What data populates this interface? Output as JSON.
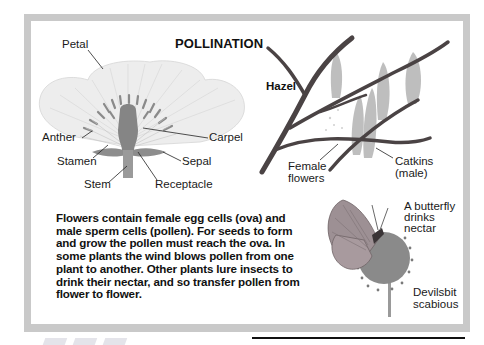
{
  "title": "POLLINATION",
  "flower_diagram": {
    "labels": {
      "petal": "Petal",
      "anther": "Anther",
      "stamen": "Stamen",
      "stem": "Stem",
      "carpel": "Carpel",
      "sepal": "Sepal",
      "receptacle": "Receptacle"
    }
  },
  "hazel_diagram": {
    "title": "Hazel",
    "labels": {
      "female_line1": "Female",
      "female_line2": "flowers",
      "catkins_line1": "Catkins",
      "catkins_line2": "(male)"
    }
  },
  "butterfly_diagram": {
    "caption_lines": [
      "A butterfly",
      "drinks",
      "nectar"
    ],
    "plant_lines": [
      "Devilsbit",
      "scabious"
    ]
  },
  "body_text": {
    "lines": [
      "Flowers contain female egg cells (ova) and",
      "male sperm cells (pollen). For seeds to form",
      "and grow the pollen must reach the ova. In",
      "some plants the wind blows pollen from one",
      "plant to another. Other plants lure insects to",
      "drink their nectar, and so transfer pollen from",
      "flower to flower."
    ]
  },
  "colors": {
    "frame": "#c9c9c9",
    "petal": "#ececec",
    "flower_center": "#8a8a8a",
    "branch": "#4a4344",
    "catkin": "#b5b5b5",
    "butterfly_wing": "#9a8f92",
    "scabious": "#8e8e8e"
  }
}
